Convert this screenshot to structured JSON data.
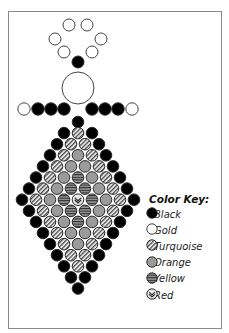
{
  "diagram": {
    "type": "bead-pattern",
    "colors": {
      "black": "#000000",
      "gold": "#ffffff",
      "orange": "#9b9b9b",
      "outline": "#333333"
    },
    "head_loop": [
      {
        "x": 69,
        "y": 25,
        "color": "gold"
      },
      {
        "x": 87,
        "y": 25,
        "color": "gold"
      },
      {
        "x": 55,
        "y": 39,
        "color": "gold"
      },
      {
        "x": 101,
        "y": 39,
        "color": "gold"
      },
      {
        "x": 64,
        "y": 52,
        "color": "gold"
      },
      {
        "x": 92,
        "y": 52,
        "color": "gold"
      },
      {
        "x": 78,
        "y": 62,
        "color": "black"
      }
    ],
    "large_bead": {
      "x": 78,
      "y": 88,
      "r": 16,
      "color": "gold"
    },
    "arms": [
      {
        "x": 24,
        "y": 109,
        "color": "gold"
      },
      {
        "x": 38,
        "y": 109,
        "color": "black"
      },
      {
        "x": 51,
        "y": 109,
        "color": "black"
      },
      {
        "x": 64,
        "y": 109,
        "color": "black"
      },
      {
        "x": 92,
        "y": 109,
        "color": "black"
      },
      {
        "x": 105,
        "y": 109,
        "color": "black"
      },
      {
        "x": 118,
        "y": 109,
        "color": "black"
      },
      {
        "x": 132,
        "y": 109,
        "color": "gold"
      }
    ],
    "diamond_rows": [
      [
        "B"
      ],
      [
        "B",
        "T",
        "B"
      ],
      [
        "B",
        "T",
        "T",
        "B"
      ],
      [
        "B",
        "T",
        "O",
        "T",
        "B"
      ],
      [
        "B",
        "T",
        "O",
        "O",
        "T",
        "B"
      ],
      [
        "B",
        "T",
        "O",
        "Y",
        "O",
        "T",
        "B"
      ],
      [
        "B",
        "T",
        "O",
        "Y",
        "Y",
        "O",
        "T",
        "B"
      ],
      [
        "B",
        "T",
        "O",
        "Y",
        "R",
        "Y",
        "O",
        "T",
        "B"
      ],
      [
        "B",
        "T",
        "O",
        "Y",
        "Y",
        "O",
        "T",
        "B"
      ],
      [
        "B",
        "T",
        "O",
        "Y",
        "O",
        "T",
        "B"
      ],
      [
        "B",
        "T",
        "O",
        "O",
        "T",
        "B"
      ],
      [
        "B",
        "T",
        "O",
        "T",
        "B"
      ],
      [
        "B",
        "T",
        "T",
        "B"
      ],
      [
        "B",
        "T",
        "B"
      ],
      [
        "B",
        "B"
      ],
      [
        "B"
      ]
    ],
    "diamond_layout": {
      "center_x": 78,
      "top_y": 122,
      "row_spacing": 11.1,
      "bead_spacing": 14,
      "bead_r": 5.8
    }
  },
  "color_key": {
    "title": "Color Key:",
    "items": [
      {
        "code": "B",
        "label": "Black"
      },
      {
        "code": "G",
        "label": "Gold"
      },
      {
        "code": "T",
        "label": "Turquoise"
      },
      {
        "code": "O",
        "label": "Orange"
      },
      {
        "code": "Y",
        "label": "Yellow"
      },
      {
        "code": "R",
        "label": "Red"
      }
    ]
  }
}
